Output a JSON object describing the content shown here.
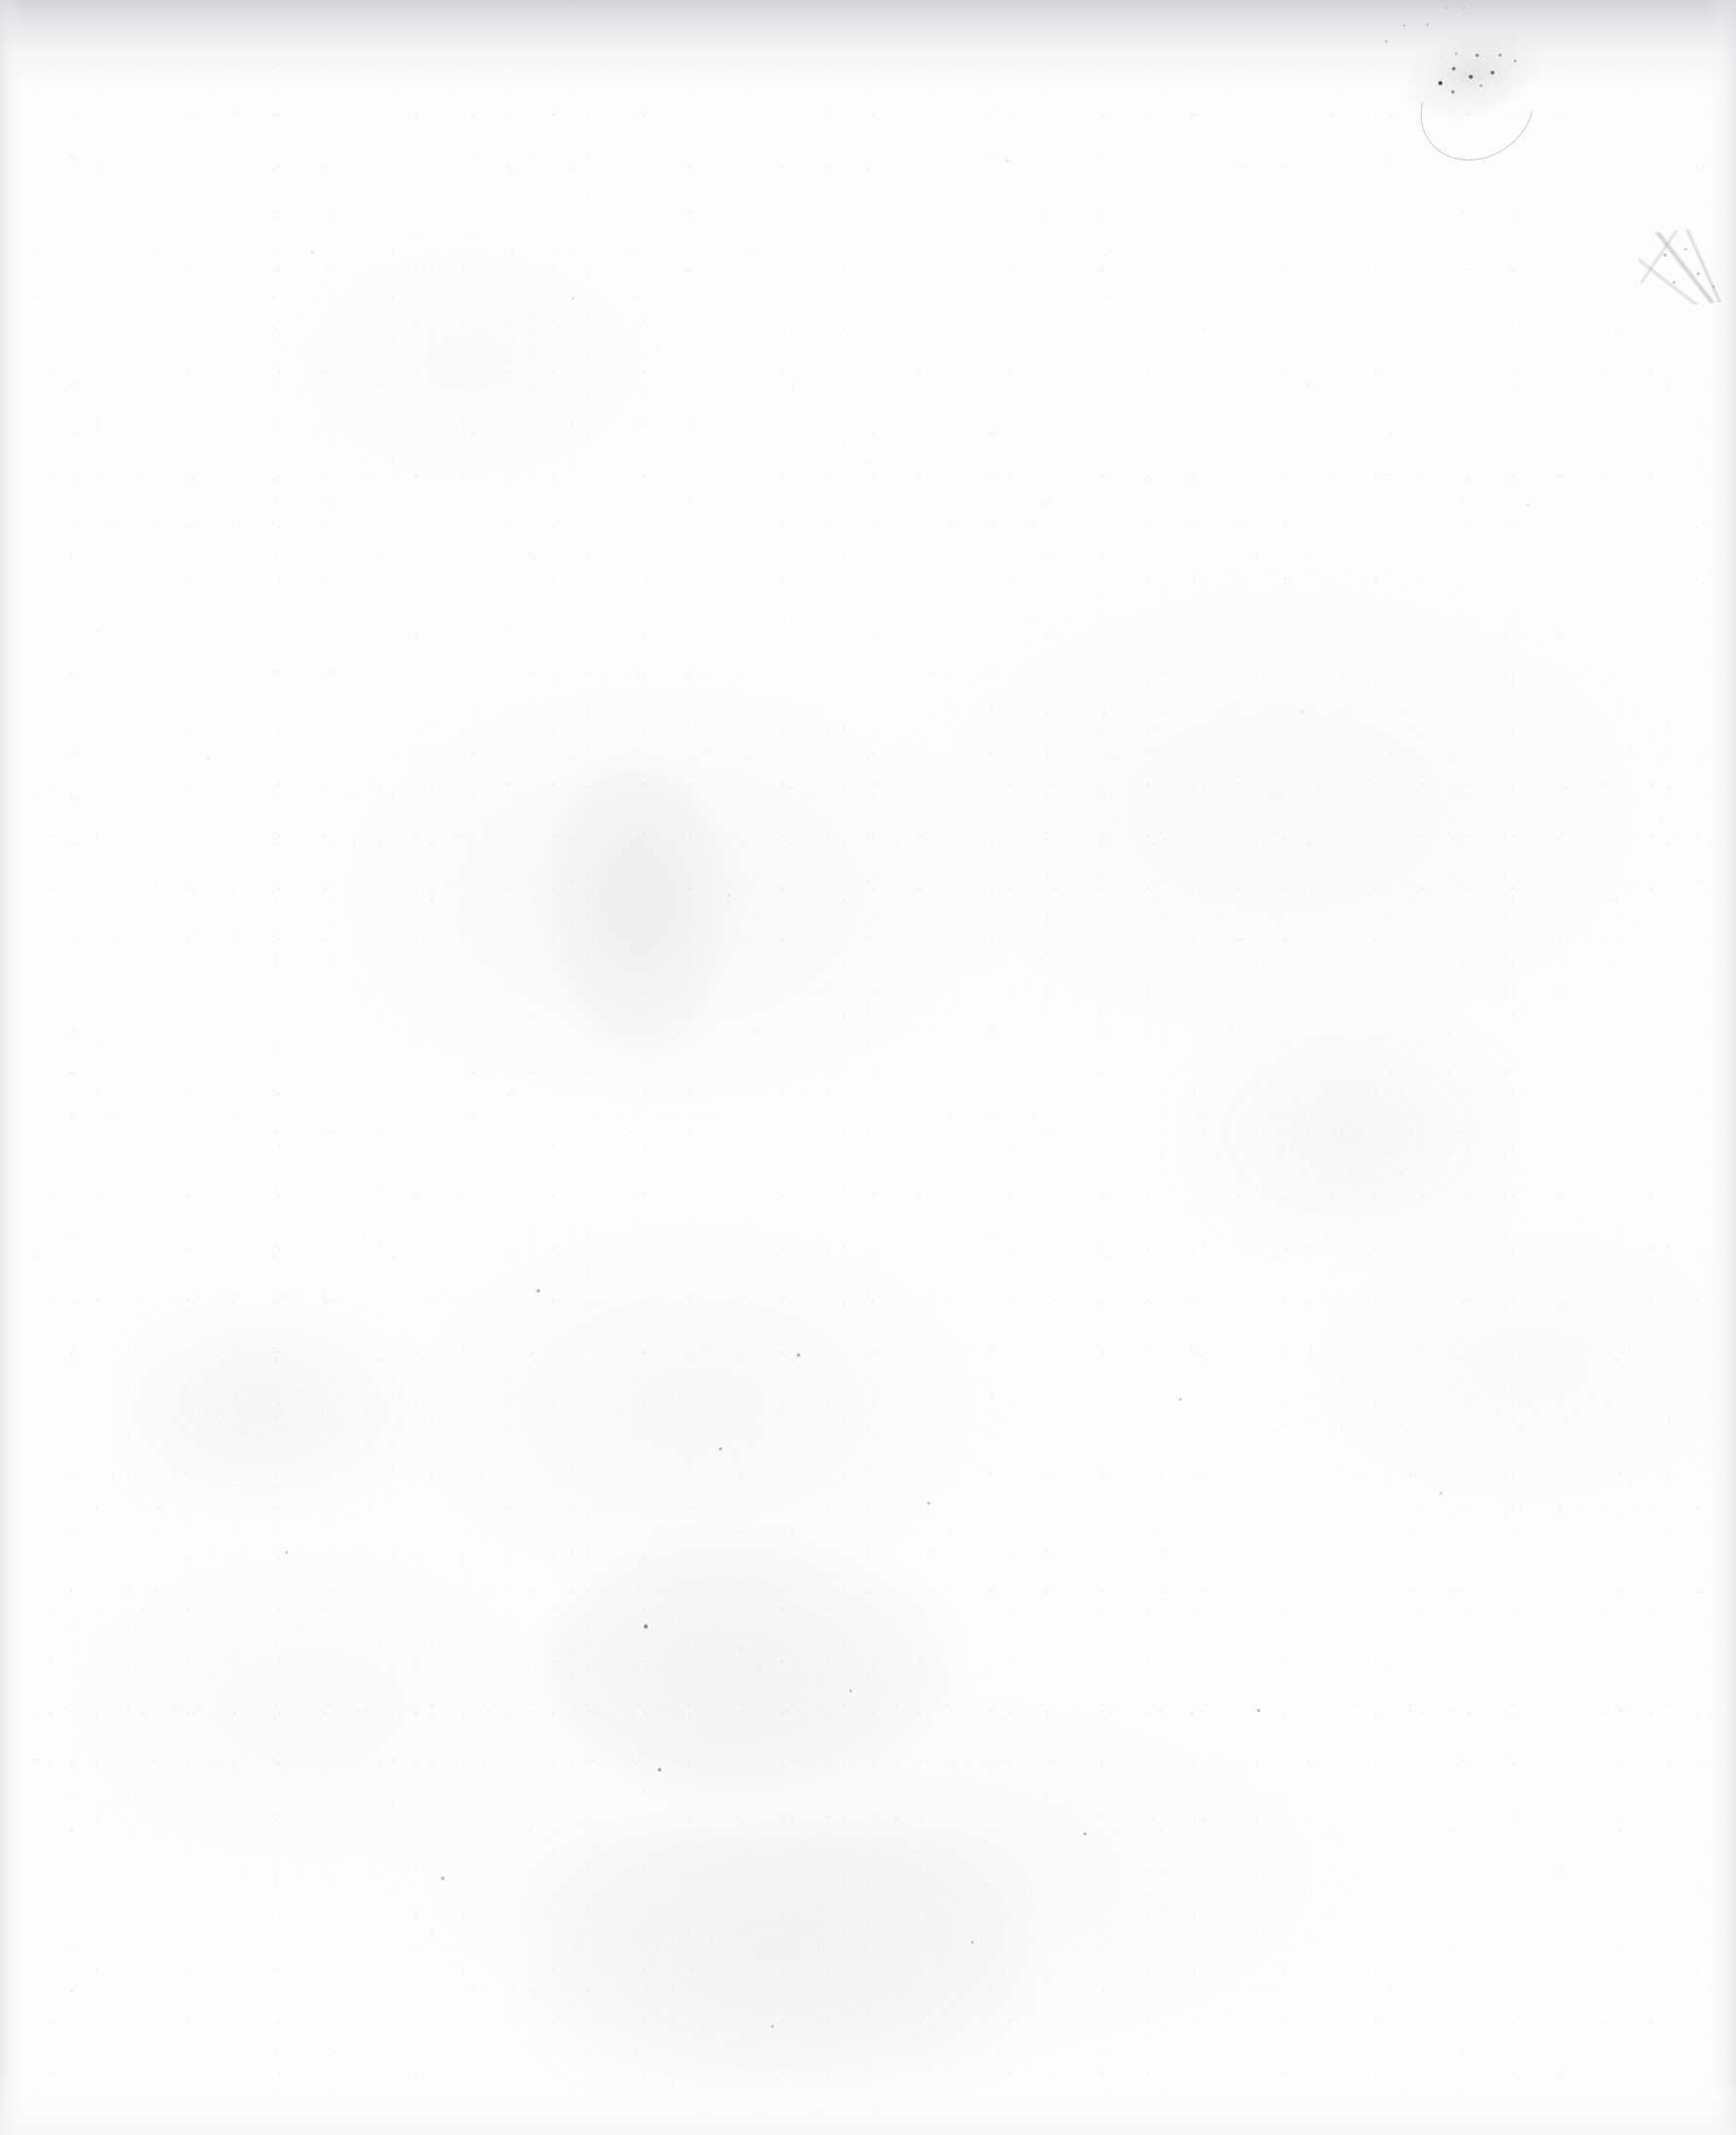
{
  "page": {
    "kind": "blank-scanned-page",
    "content_text": "",
    "description": "Blank page from a scanned document. No printed or handwritten text is present.",
    "width_px": 1785,
    "height_px": 2195
  },
  "colors": {
    "paper": "#fdfdfd",
    "top_edge_shadow": "#cdcdd0",
    "side_edge_shadow": "#e2e2e5",
    "bottom_edge_shadow": "#f6f6f7",
    "speck_dark": "#5c5a64",
    "speck_light": "#86848e",
    "stain": "#969aa2"
  },
  "artifacts": [
    {
      "id": "scuff-mark",
      "label": "Scuff / abrasion mark",
      "region": "top-right",
      "x": 1436,
      "y": 10,
      "width": 190,
      "height": 150
    },
    {
      "id": "pencil-scratches",
      "label": "Faint pencil-like scratches",
      "region": "upper-right",
      "x": 1686,
      "y": 236,
      "width": 96,
      "height": 78
    },
    {
      "id": "top-edge-shadow",
      "label": "Scanner edge shadow",
      "region": "top",
      "x": 0,
      "y": 0,
      "width": 1785,
      "height": 110
    },
    {
      "id": "left-edge-shadow",
      "label": "Scanner gutter shading",
      "region": "left",
      "x": 0,
      "y": 0,
      "width": 26,
      "height": 2195
    },
    {
      "id": "right-edge-shadow",
      "label": "Scanner gutter shading",
      "region": "right",
      "x": 1755,
      "y": 0,
      "width": 30,
      "height": 2195
    },
    {
      "id": "dust-specks",
      "label": "Scattered dust and ink specks",
      "region": "lower-half",
      "x": 0,
      "y": 1180,
      "width": 1785,
      "height": 1015
    },
    {
      "id": "foxing-stains",
      "label": "Diffuse pale stains / foxing",
      "region": "center and lower-center",
      "x": 540,
      "y": 790,
      "width": 520,
      "height": 1365
    }
  ]
}
